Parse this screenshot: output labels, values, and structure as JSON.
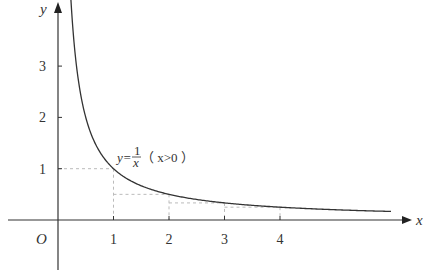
{
  "chart_data": {
    "type": "line",
    "title": "",
    "xlabel": "x",
    "ylabel": "y",
    "origin_label": "O",
    "xlim": [
      -1,
      6.2
    ],
    "ylim": [
      -1,
      3.6
    ],
    "grid": false,
    "x_ticks": [
      "1",
      "2",
      "3",
      "4"
    ],
    "y_ticks": [
      "1",
      "2",
      "3"
    ],
    "series": [
      {
        "name": "y=1/x (x>0)",
        "function": "y = 1/x",
        "domain": "x > 0",
        "x": [
          0.12,
          0.25,
          0.5,
          0.75,
          1,
          1.5,
          2,
          2.5,
          3,
          3.5,
          4,
          5,
          6
        ],
        "y": [
          8.33,
          4.0,
          2.0,
          1.333,
          1.0,
          0.667,
          0.5,
          0.4,
          0.333,
          0.286,
          0.25,
          0.2,
          0.167
        ]
      }
    ],
    "annotations": {
      "curve_label": {
        "prefix": "y=",
        "numerator": "1",
        "denominator": "x",
        "condition": "（ x>0 ）"
      },
      "dashed_rectangles": [
        {
          "x_from": 0,
          "x_to": 1,
          "height": 1
        },
        {
          "x_from": 1,
          "x_to": 2,
          "height": 0.5
        },
        {
          "x_from": 2,
          "x_to": 3,
          "height": 0.333
        },
        {
          "x_from": 3,
          "x_to": 4,
          "height": 0.25
        }
      ]
    },
    "colors": {
      "axis": "#333333",
      "curve": "#333333",
      "dashed": "#bbbbbb"
    }
  }
}
